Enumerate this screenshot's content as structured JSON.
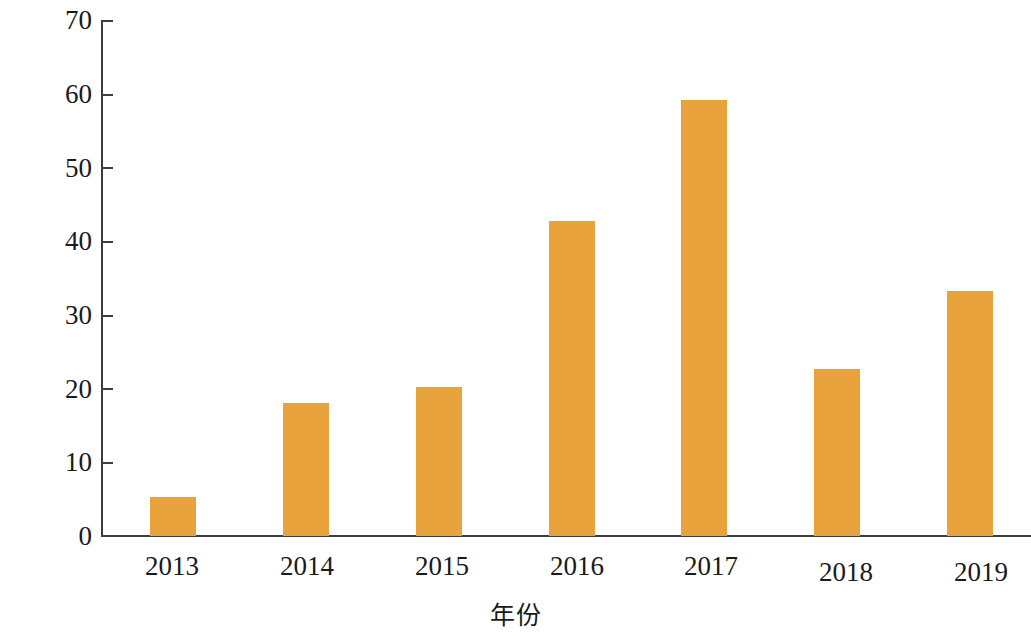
{
  "chart_data": {
    "type": "bar",
    "title": "",
    "subtitle": "",
    "xlabel": "年份",
    "ylabel": "比值（%）",
    "categories": [
      "2013",
      "2014",
      "2015",
      "2016",
      "2017",
      "2018",
      "2019"
    ],
    "values": [
      5.3,
      18.1,
      20.2,
      42.7,
      59.1,
      22.7,
      33.2
    ],
    "series": [
      {
        "name": "比值",
        "values": [
          5.3,
          18.1,
          20.2,
          42.7,
          59.1,
          22.7,
          33.2
        ]
      }
    ],
    "ylim": [
      0,
      70
    ],
    "ytick_labels": [
      "0",
      "10",
      "20",
      "30",
      "40",
      "50",
      "60",
      "70"
    ],
    "ytick_values": [
      0,
      10,
      20,
      30,
      40,
      50,
      60,
      70
    ],
    "grid": false,
    "legend": false,
    "legend_position": "none",
    "bar_color": "#e8a33d",
    "axis_color": "#3d3d3d",
    "background": "#ffffff",
    "annotations": []
  }
}
